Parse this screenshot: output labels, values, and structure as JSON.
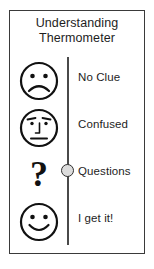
{
  "card": {
    "title_line1": "Understanding",
    "title_line2": "Thermometer",
    "border_color": "#3a3a3a",
    "background_color": "#ffffff"
  },
  "scale": {
    "line_color": "#4a4a4a",
    "marker": {
      "name": "scale-marker-bead",
      "fill_color": "#dcdcdc",
      "outline_color": "#2f2f2f",
      "at_level": "Questions"
    }
  },
  "levels": [
    {
      "label": "No Clue",
      "icon": "sad-face-icon",
      "icon_description": "frowning face with two dot eyes"
    },
    {
      "label": "Confused",
      "icon": "confused-face-icon",
      "icon_description": "face with slanted eyebrows, nose line and flat mouth"
    },
    {
      "label": "Questions",
      "icon": "question-mark-icon",
      "icon_description": "large bold question mark",
      "glyph": "?"
    },
    {
      "label": "I get it!",
      "icon": "smiley-face-icon",
      "icon_description": "smiling face with two dot eyes"
    }
  ]
}
